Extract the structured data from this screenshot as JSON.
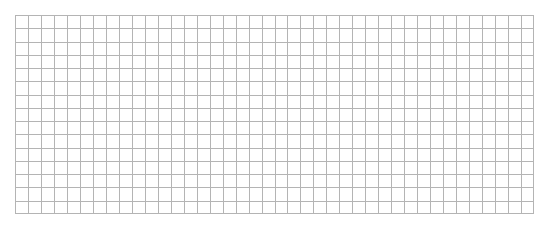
{
  "grid": {
    "columns": 40,
    "rows": 15,
    "line_color": "#b4b4b4",
    "background_color": "#ffffff"
  }
}
